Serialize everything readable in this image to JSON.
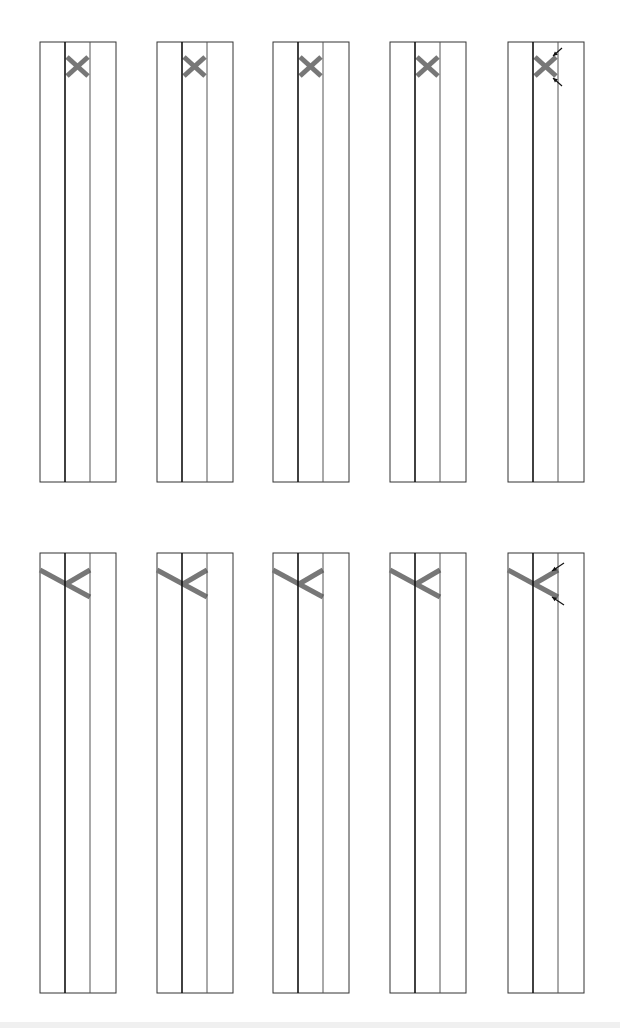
{
  "diagram": {
    "colors": {
      "outline": "#333333",
      "center_line": "#111111",
      "divider": "#555555",
      "cross": "#777777",
      "arrow": "#111111",
      "background": "#ffffff"
    },
    "rows": [
      {
        "id": "row-1",
        "top": 42,
        "bottom": 482,
        "shape": "x-cross",
        "panels": [
          {
            "x": 40,
            "arrows": false
          },
          {
            "x": 157,
            "arrows": false
          },
          {
            "x": 273,
            "arrows": false
          },
          {
            "x": 390,
            "arrows": false
          },
          {
            "x": 508,
            "arrows": true
          }
        ]
      },
      {
        "id": "row-2",
        "top": 553,
        "bottom": 993,
        "shape": "k-cross",
        "panels": [
          {
            "x": 40,
            "arrows": false
          },
          {
            "x": 157,
            "arrows": false
          },
          {
            "x": 273,
            "arrows": false
          },
          {
            "x": 390,
            "arrows": false
          },
          {
            "x": 508,
            "arrows": true
          }
        ]
      }
    ],
    "panel_width": 76,
    "lane_width": 25
  }
}
